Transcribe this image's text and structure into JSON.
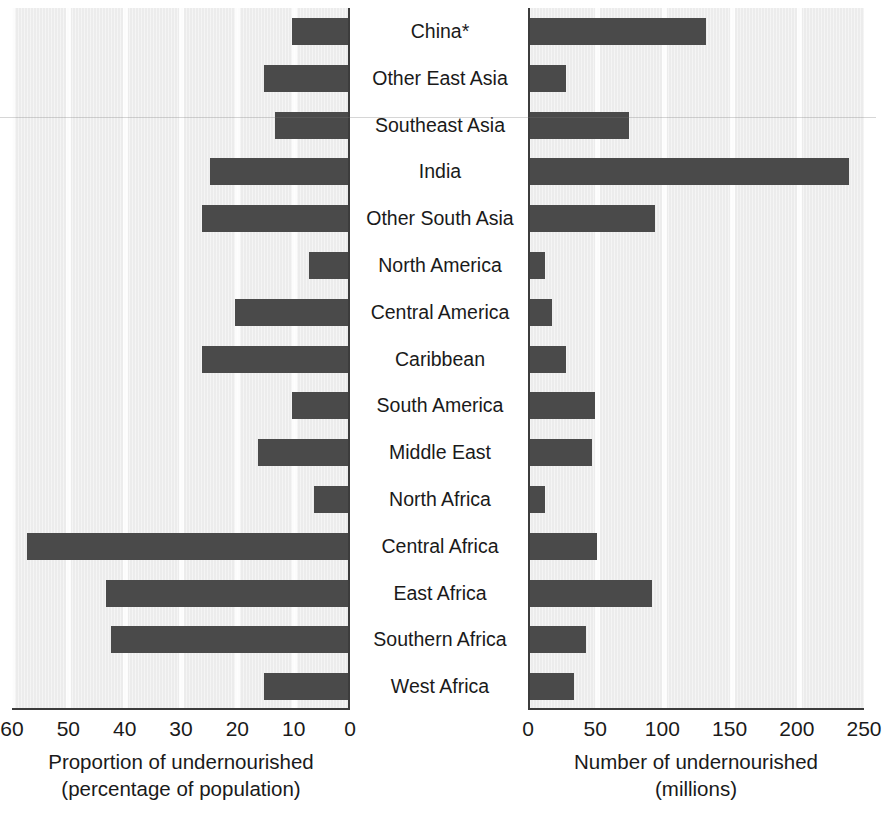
{
  "chart_data": {
    "type": "bar",
    "orientation": "horizontal-paired-pyramid",
    "categories": [
      "China*",
      "Other East Asia",
      "Southeast Asia",
      "India",
      "Other South Asia",
      "North America",
      "Central America",
      "Caribbean",
      "South America",
      "Middle East",
      "North Africa",
      "Central Africa",
      "East Africa",
      "Southern Africa",
      "West Africa"
    ],
    "panels": [
      {
        "id": "left",
        "title": "Proportion of undernourished",
        "subtitle": "(percentage of population)",
        "xlabel": "Proportion of undernourished (percentage of population)",
        "unit": "percent",
        "direction": "right-to-left",
        "xlim": [
          0,
          60
        ],
        "ticks": [
          60,
          50,
          40,
          30,
          20,
          10,
          0
        ],
        "tick_labels": [
          "60",
          "50",
          "40",
          "30",
          "20",
          "10",
          "0"
        ],
        "values": [
          10,
          15,
          13,
          24.5,
          26,
          7,
          20,
          26,
          10,
          16,
          6,
          57,
          43,
          42,
          15
        ]
      },
      {
        "id": "right",
        "title": "Number of undernourished",
        "subtitle": "(millions)",
        "xlabel": "Number of undernourished (millions)",
        "unit": "millions",
        "direction": "left-to-right",
        "xlim": [
          0,
          250
        ],
        "ticks": [
          0,
          50,
          100,
          150,
          200,
          250
        ],
        "tick_labels": [
          "0",
          "50",
          "100",
          "150",
          "200",
          "250"
        ],
        "values": [
          131,
          27,
          74,
          237,
          93,
          11,
          16,
          27,
          48,
          46,
          11,
          50,
          91,
          42,
          33
        ]
      }
    ],
    "grid": true,
    "legend": null,
    "bar_color": "#4a4a4a",
    "plot_background": "#ececec",
    "footnote_marker": "*"
  }
}
